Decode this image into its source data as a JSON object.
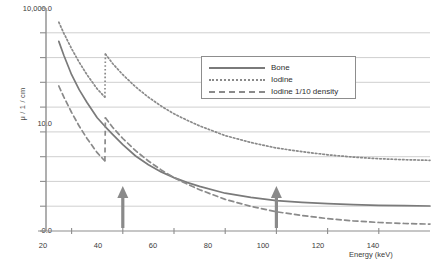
{
  "chart_data": {
    "type": "line",
    "title": "",
    "xlabel": "Energy (keV)",
    "ylabel": "μ / 1 / cm",
    "xlim": [
      10,
      160
    ],
    "ylim": [
      0.0,
      10000.0
    ],
    "yscale": "log",
    "grid": true,
    "legend_position": "upper-center-right",
    "xticks": [
      "20",
      "40",
      "60",
      "80",
      "100",
      "120",
      "140"
    ],
    "xtick_values": [
      20,
      40,
      60,
      80,
      100,
      120,
      140
    ],
    "yticks": [
      "10,000.0",
      "10.0",
      "0.0"
    ],
    "ytick_values": [
      10000.0,
      10.0,
      0.0
    ],
    "series": [
      {
        "name": "Bone",
        "style": "solid",
        "color": "#7a7a7a",
        "x": [
          15,
          17,
          20,
          23,
          26,
          30,
          33,
          36,
          40,
          45,
          50,
          55,
          60,
          65,
          70,
          80,
          90,
          100,
          110,
          120,
          130,
          140,
          150,
          160
        ],
        "y": [
          3000,
          1800,
          900,
          520,
          330,
          190,
          140,
          105,
          72,
          48,
          35,
          27,
          22,
          18.5,
          16,
          12.5,
          10.8,
          9.6,
          9.0,
          8.6,
          8.3,
          8.1,
          8.0,
          7.9
        ]
      },
      {
        "name": "Iodine",
        "style": "dotted",
        "color": "#8a8a8a",
        "x": [
          15,
          17,
          20,
          23,
          26,
          30,
          33,
          33.2,
          36,
          40,
          45,
          50,
          55,
          60,
          65,
          70,
          80,
          90,
          100,
          110,
          120,
          130,
          140,
          150,
          160
        ],
        "y": [
          6000,
          4000,
          2300,
          1400,
          900,
          540,
          400,
          1900,
          1350,
          900,
          580,
          400,
          290,
          220,
          175,
          142,
          100,
          78,
          64,
          56,
          50,
          46,
          43.5,
          42,
          41
        ],
        "k_edge_keV": 33
      },
      {
        "name": "Iodine 1/10 density",
        "style": "dashed",
        "color": "#8a8a8a",
        "x": [
          15,
          17,
          20,
          23,
          26,
          30,
          33,
          33.2,
          36,
          40,
          45,
          50,
          55,
          60,
          65,
          70,
          80,
          90,
          100,
          110,
          120,
          130,
          140,
          150,
          160
        ],
        "y": [
          600,
          400,
          230,
          140,
          90,
          54,
          40,
          190,
          135,
          90,
          58,
          40,
          29,
          22,
          17.5,
          14.2,
          10.0,
          7.8,
          6.4,
          5.6,
          5.0,
          4.6,
          4.35,
          4.2,
          4.1
        ],
        "k_edge_keV": 33
      }
    ],
    "annotations": [
      {
        "name": "arrow-marker-40kev",
        "type": "up-arrow",
        "x": 40,
        "label": "40 keV",
        "color": "#8a8a8a"
      },
      {
        "name": "arrow-marker-100kev",
        "type": "up-arrow",
        "x": 100,
        "label": "100 keV",
        "color": "#8a8a8a"
      }
    ],
    "gridline_count": 8,
    "colors": {
      "grid": "#cfcfcf",
      "axis": "#8d8d8d",
      "curve": "#7a7a7a",
      "arrow": "#8a8a8a",
      "text": "#3a3a3a",
      "background": "#ffffff"
    }
  },
  "legend": {
    "items": [
      {
        "label": "Bone",
        "style": "solid"
      },
      {
        "label": "Iodine",
        "style": "dotted"
      },
      {
        "label": "Iodine 1/10 density",
        "style": "dashed"
      }
    ]
  },
  "axes": {
    "y_title": "μ / 1 / cm",
    "x_title": "Energy (keV)",
    "y_labels": [
      "10,000.0",
      "10.0",
      "0.0"
    ],
    "x_labels": [
      "20",
      "40",
      "60",
      "80",
      "100",
      "120",
      "140"
    ]
  }
}
